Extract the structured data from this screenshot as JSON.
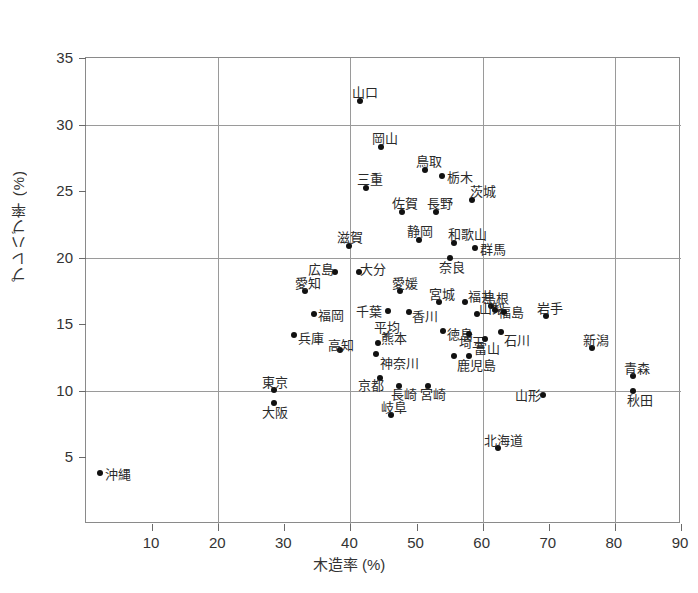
{
  "chart_data": {
    "type": "scatter",
    "title": "",
    "xlabel": "木造率 (%)",
    "ylabel": "プレハブ率 (%)",
    "xlim": [
      0,
      90
    ],
    "ylim": [
      0,
      35
    ],
    "xticks": [
      10,
      20,
      30,
      40,
      50,
      60,
      70,
      80,
      90
    ],
    "yticks": [
      5,
      10,
      15,
      20,
      25,
      30,
      35
    ],
    "grid": "major gridlines at y=10,20,30 and x=20,40,60,80",
    "legend": "none",
    "point_marker": "filled-circle",
    "average_marker": "x-cross",
    "points": [
      {
        "label": "山口",
        "x": 41.5,
        "y": 31.8,
        "lx": -8,
        "ly": -15
      },
      {
        "label": "岡山",
        "x": 44.6,
        "y": 28.3,
        "lx": -9,
        "ly": -15
      },
      {
        "label": "鳥取",
        "x": 51.3,
        "y": 26.6,
        "lx": -9,
        "ly": -15
      },
      {
        "label": "栃木",
        "x": 53.9,
        "y": 26.1,
        "lx": 5,
        "ly": -5
      },
      {
        "label": "三重",
        "x": 42.3,
        "y": 25.2,
        "lx": -9,
        "ly": -15
      },
      {
        "label": "佐賀",
        "x": 47.8,
        "y": 23.4,
        "lx": -10,
        "ly": -15
      },
      {
        "label": "長野",
        "x": 53.0,
        "y": 23.4,
        "lx": -9,
        "ly": -15
      },
      {
        "label": "茨城",
        "x": 58.4,
        "y": 24.3,
        "lx": -2,
        "ly": -15
      },
      {
        "label": "和歌山",
        "x": 55.6,
        "y": 21.1,
        "lx": -6,
        "ly": -15
      },
      {
        "label": "静岡",
        "x": 50.3,
        "y": 21.3,
        "lx": -12,
        "ly": -15
      },
      {
        "label": "滋賀",
        "x": 39.8,
        "y": 20.9,
        "lx": -12,
        "ly": -15
      },
      {
        "label": "群馬",
        "x": 58.9,
        "y": 20.7,
        "lx": 5,
        "ly": -5
      },
      {
        "label": "奈良",
        "x": 55.0,
        "y": 20.0,
        "lx": -11,
        "ly": 3
      },
      {
        "label": "広島",
        "x": 37.7,
        "y": 18.9,
        "lx": -27,
        "ly": -9
      },
      {
        "label": "大分",
        "x": 41.3,
        "y": 18.9,
        "lx": 1,
        "ly": -9
      },
      {
        "label": "愛知",
        "x": 33.2,
        "y": 17.5,
        "lx": -10,
        "ly": -14
      },
      {
        "label": "愛媛",
        "x": 47.5,
        "y": 17.5,
        "lx": -8,
        "ly": -14
      },
      {
        "label": "宮城",
        "x": 53.4,
        "y": 16.7,
        "lx": -10,
        "ly": -14
      },
      {
        "label": "福井",
        "x": 57.4,
        "y": 16.7,
        "lx": 3,
        "ly": -12
      },
      {
        "label": "島根",
        "x": 61.2,
        "y": 16.4,
        "lx": -8,
        "ly": -14
      },
      {
        "label": "福岡",
        "x": 34.5,
        "y": 15.8,
        "lx": 4,
        "ly": -5
      },
      {
        "label": "千葉",
        "x": 45.7,
        "y": 16.0,
        "lx": -32,
        "ly": -6
      },
      {
        "label": "香川",
        "x": 48.9,
        "y": 15.9,
        "lx": 3,
        "ly": -2
      },
      {
        "label": "山梨",
        "x": 59.2,
        "y": 15.8,
        "lx": 2,
        "ly": -12
      },
      {
        "label": "福島",
        "x": 61.9,
        "y": 16.1,
        "lx": 3,
        "ly": -4
      },
      {
        "label": "岩手",
        "x": 69.6,
        "y": 15.6,
        "lx": -9,
        "ly": -14
      },
      {
        "label": "福島2",
        "x": 63.3,
        "y": 15.9,
        "lx": 3,
        "ly": -2
      },
      {
        "label": "平均",
        "x": 45.4,
        "y": 14.2,
        "lx": -12,
        "ly": -14,
        "marker": "cross"
      },
      {
        "label": "徳島",
        "x": 54.0,
        "y": 14.5,
        "lx": 4,
        "ly": -3
      },
      {
        "label": "兵庫",
        "x": 31.4,
        "y": 14.2,
        "lx": 4,
        "ly": -3
      },
      {
        "label": "熊本",
        "x": 44.1,
        "y": 13.6,
        "lx": 3,
        "ly": -11
      },
      {
        "label": "埼玉",
        "x": 58.0,
        "y": 14.3,
        "lx": -10,
        "ly": 2
      },
      {
        "label": "富山",
        "x": 60.4,
        "y": 13.9,
        "lx": -11,
        "ly": 3
      },
      {
        "label": "石川",
        "x": 62.7,
        "y": 14.4,
        "lx": 3,
        "ly": 2
      },
      {
        "label": "新潟",
        "x": 76.6,
        "y": 13.2,
        "lx": -9,
        "ly": -14
      },
      {
        "label": "高知",
        "x": 38.4,
        "y": 13.1,
        "lx": -12,
        "ly": -11
      },
      {
        "label": "神奈川",
        "x": 43.9,
        "y": 12.8,
        "lx": 4,
        "ly": 3
      },
      {
        "label": "鹿児島",
        "x": 55.7,
        "y": 12.6,
        "lx": 3,
        "ly": 3
      },
      {
        "label": "鹿児島2",
        "x": 57.9,
        "y": 12.6,
        "lx": 0,
        "ly": 0
      },
      {
        "label": "青森",
        "x": 82.8,
        "y": 11.1,
        "lx": -9,
        "ly": -14
      },
      {
        "label": "秋田",
        "x": 82.8,
        "y": 10.0,
        "lx": -6,
        "ly": 3
      },
      {
        "label": "京都",
        "x": 44.5,
        "y": 11.0,
        "lx": -22,
        "ly": 1
      },
      {
        "label": "長崎",
        "x": 47.3,
        "y": 10.4,
        "lx": -8,
        "ly": 2
      },
      {
        "label": "宮崎",
        "x": 51.8,
        "y": 10.4,
        "lx": -8,
        "ly": 2
      },
      {
        "label": "東京",
        "x": 28.5,
        "y": 10.1,
        "lx": -12,
        "ly": -14
      },
      {
        "label": "大阪",
        "x": 28.5,
        "y": 9.1,
        "lx": -12,
        "ly": 3
      },
      {
        "label": "山形",
        "x": 69.1,
        "y": 9.7,
        "lx": -28,
        "ly": -6
      },
      {
        "label": "岐阜",
        "x": 46.1,
        "y": 8.2,
        "lx": -10,
        "ly": -14
      },
      {
        "label": "北海道",
        "x": 62.3,
        "y": 5.7,
        "lx": -14,
        "ly": -14
      },
      {
        "label": "沖縄",
        "x": 2.1,
        "y": 3.8,
        "lx": 5,
        "ly": -5
      }
    ]
  },
  "axes": {
    "y_title": "プレハブ率 (%)",
    "x_title": "木造率 (%)",
    "y_labels": [
      "35",
      "30",
      "25",
      "20",
      "15",
      "10",
      "5"
    ],
    "x_labels": [
      "10",
      "20",
      "30",
      "40",
      "50",
      "60",
      "70",
      "80",
      "90"
    ]
  },
  "colors": {
    "point": "#111111",
    "grid": "#9a9a9a",
    "frame": "#8a8a8a",
    "text": "#2a2a2a"
  }
}
